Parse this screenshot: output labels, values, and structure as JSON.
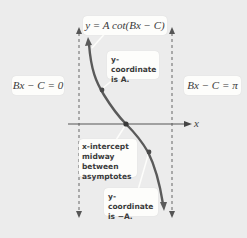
{
  "title": {
    "text": "y = A cot(Bx − C)"
  },
  "asymptotes": {
    "left_label": "Bx − C = 0",
    "right_label": "Bx − C = π"
  },
  "axis": {
    "x_label": "x"
  },
  "annotations": {
    "top_point": {
      "line1": "y-coordinate",
      "line2": "is A."
    },
    "intercept": {
      "line1": "x-intercept",
      "line2": "midway between",
      "line3": "asymptotes"
    },
    "bottom_point": {
      "line1": "y-coordinate",
      "line2": "is −A."
    }
  },
  "colors": {
    "background": "#ececec",
    "curve": "#5a5a5a",
    "axis": "#555555",
    "asymptote": "#666666",
    "box": "#fdfdfb",
    "text": "#3a3a3a"
  }
}
